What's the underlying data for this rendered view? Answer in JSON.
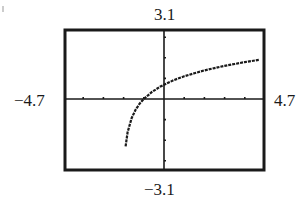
{
  "chart_data": {
    "type": "line",
    "title": "",
    "xlabel": "",
    "ylabel": "",
    "window": {
      "xmin": -4.7,
      "xmax": 4.7,
      "ymin": -3.1,
      "ymax": 3.1,
      "xscl": 1,
      "yscl": 1
    },
    "labels": {
      "ymax": "3.1",
      "ymin": "−3.1",
      "xmin": "−4.7",
      "xmax": "4.7"
    },
    "grid": false,
    "legend": null,
    "style": "graphing-calculator-screen",
    "series": [
      {
        "name": "curve",
        "description": "increasing logarithmic-shaped curve, vertical asymptote near x=-2",
        "x": [
          -1.9,
          -1.8,
          -1.6,
          -1.4,
          -1.2,
          -1.0,
          -0.6,
          -0.2,
          0.0,
          0.5,
          1.0,
          1.5,
          2.0,
          2.5,
          3.0,
          3.5,
          4.0,
          4.5,
          4.7
        ],
        "y": [
          -2.3,
          -1.61,
          -0.92,
          -0.51,
          -0.22,
          0.0,
          0.34,
          0.59,
          0.69,
          0.92,
          1.1,
          1.25,
          1.39,
          1.5,
          1.61,
          1.7,
          1.79,
          1.87,
          1.9
        ]
      }
    ],
    "x_intercept": -1.0,
    "y_intercept": 0.69
  },
  "colors": {
    "ink": "#1a1a1a",
    "background": "#ffffff"
  }
}
